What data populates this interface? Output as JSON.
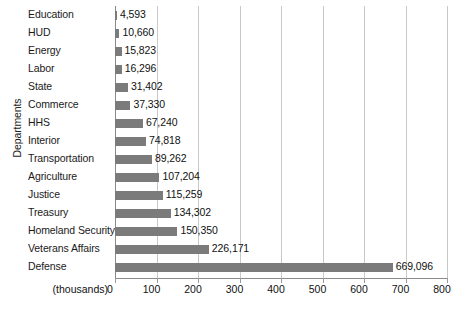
{
  "chart_data": {
    "type": "bar",
    "orientation": "horizontal",
    "title": "",
    "xlabel": "(thousands)",
    "ylabel": "Departments",
    "xlim": [
      0,
      800
    ],
    "xticks": [
      0,
      100,
      200,
      300,
      400,
      500,
      600,
      700,
      800
    ],
    "xtick_labels": [
      "0",
      "100",
      "200",
      "300",
      "400",
      "500",
      "600",
      "700",
      "800"
    ],
    "grid": "vertical",
    "legend": "none",
    "value_unit": "thousands",
    "bar_color": "#7b7b7b",
    "gridline_color": "#c9c9c9",
    "categories": [
      "Education",
      "HUD",
      "Energy",
      "Labor",
      "State",
      "Commerce",
      "HHS",
      "Interior",
      "Transportation",
      "Agriculture",
      "Justice",
      "Treasury",
      "Homeland Security",
      "Veterans Affairs",
      "Defense"
    ],
    "values": [
      4593,
      10660,
      15823,
      16296,
      31402,
      37330,
      67240,
      74818,
      89262,
      107204,
      115259,
      134302,
      150350,
      226171,
      669096
    ],
    "value_labels": [
      "4,593",
      "10,660",
      "15,823",
      "16,296",
      "31,402",
      "37,330",
      "67,240",
      "74,818",
      "89,262",
      "107,204",
      "115,259",
      "134,302",
      "150,350",
      "226,171",
      "669,096"
    ]
  }
}
